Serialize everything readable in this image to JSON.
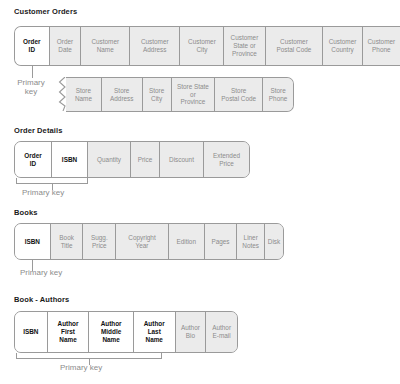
{
  "diagram": {
    "primary_key_label": "Primary key",
    "colors": {
      "cell_fill": "#ebebeb",
      "pk_fill": "#ffffff",
      "border": "#9a9a9a",
      "text": "#8c8c8c",
      "pk_text": "#111111",
      "title_text": "#1a1a1a"
    }
  },
  "tables": [
    {
      "name": "Customer Orders",
      "row1": [
        {
          "label": "Order\nID",
          "pk": true
        },
        {
          "label": "Order\nDate",
          "pk": false
        },
        {
          "label": "Customer\nName",
          "pk": false
        },
        {
          "label": "Customer\nAddress",
          "pk": false
        },
        {
          "label": "Customer\nCity",
          "pk": false
        },
        {
          "label": "Customer\nState or\nProvince",
          "pk": false
        },
        {
          "label": "Customer\nPostal Code",
          "pk": false
        },
        {
          "label": "Customer\nCountry",
          "pk": false
        },
        {
          "label": "Customer\nPhone",
          "pk": false
        }
      ],
      "row2": [
        {
          "label": "Store\nName",
          "pk": false
        },
        {
          "label": "Store\nAddress",
          "pk": false
        },
        {
          "label": "Store\nCity",
          "pk": false
        },
        {
          "label": "Store State\nor\nProvince",
          "pk": false
        },
        {
          "label": "Store\nPostal Code",
          "pk": false
        },
        {
          "label": "Store\nPhone",
          "pk": false
        }
      ]
    },
    {
      "name": "Order Details",
      "row1": [
        {
          "label": "Order\nID",
          "pk": true
        },
        {
          "label": "ISBN",
          "pk": true
        },
        {
          "label": "Quantity",
          "pk": false
        },
        {
          "label": "Price",
          "pk": false
        },
        {
          "label": "Discount",
          "pk": false
        },
        {
          "label": "Extended\nPrice",
          "pk": false
        }
      ]
    },
    {
      "name": "Books",
      "row1": [
        {
          "label": "ISBN",
          "pk": true
        },
        {
          "label": "Book\nTitle",
          "pk": false
        },
        {
          "label": "Sugg.\nPrice",
          "pk": false
        },
        {
          "label": "Copyright\nYear",
          "pk": false
        },
        {
          "label": "Edition",
          "pk": false
        },
        {
          "label": "Pages",
          "pk": false
        },
        {
          "label": "Liner\nNotes",
          "pk": false
        },
        {
          "label": "Disk",
          "pk": false
        }
      ]
    },
    {
      "name": "Book - Authors",
      "row1": [
        {
          "label": "ISBN",
          "pk": true
        },
        {
          "label": "Author\nFirst\nName",
          "pk": true
        },
        {
          "label": "Author\nMiddle\nName",
          "pk": true
        },
        {
          "label": "Author\nLast\nName",
          "pk": true
        },
        {
          "label": "Author\nBio",
          "pk": false
        },
        {
          "label": "Author\nE-mail",
          "pk": false
        }
      ]
    }
  ],
  "annotations": {
    "customer_orders_pk": "Primary\nkey",
    "order_details_pk": "Primary key",
    "books_pk": "Primary key",
    "book_authors_pk": "Primary key"
  }
}
